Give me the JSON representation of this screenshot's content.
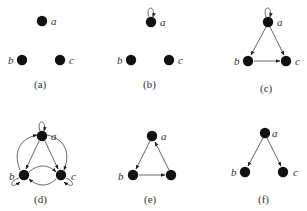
{
  "figure": {
    "panels": [
      {
        "id": "a",
        "caption": "(a)",
        "nodes": [
          {
            "id": "a",
            "label": "a",
            "x": 42,
            "y": 21
          },
          {
            "id": "b",
            "label": "b",
            "x": 22,
            "y": 60
          },
          {
            "id": "c",
            "label": "c",
            "x": 60,
            "y": 60
          }
        ],
        "edges": []
      },
      {
        "id": "b",
        "caption": "(b)",
        "nodes": [
          {
            "id": "a",
            "label": "a",
            "x": 151,
            "y": 21
          },
          {
            "id": "b",
            "label": "b",
            "x": 131,
            "y": 60
          },
          {
            "id": "c",
            "label": "c",
            "x": 169,
            "y": 60
          }
        ],
        "edges": [
          {
            "from": "a",
            "to": "a",
            "type": "loop"
          }
        ]
      },
      {
        "id": "c",
        "caption": "(c)",
        "nodes": [
          {
            "id": "a",
            "label": "a",
            "x": 268,
            "y": 22
          },
          {
            "id": "b",
            "label": "b",
            "x": 248,
            "y": 61
          },
          {
            "id": "c",
            "label": "c",
            "x": 286,
            "y": 61
          }
        ],
        "edges": [
          {
            "from": "a",
            "to": "a",
            "type": "loop"
          },
          {
            "from": "a",
            "to": "b"
          },
          {
            "from": "a",
            "to": "c"
          },
          {
            "from": "b",
            "to": "c"
          }
        ]
      },
      {
        "id": "d",
        "caption": "(d)",
        "nodes": [
          {
            "id": "a",
            "label": "a",
            "x": 42,
            "y": 136
          },
          {
            "id": "b",
            "label": "b",
            "x": 24,
            "y": 175
          },
          {
            "id": "c",
            "label": "c",
            "x": 61,
            "y": 175
          }
        ],
        "edges": [
          {
            "from": "a",
            "to": "a",
            "type": "loop"
          },
          {
            "from": "b",
            "to": "b",
            "type": "loop"
          },
          {
            "from": "c",
            "to": "c",
            "type": "loop"
          },
          {
            "from": "a",
            "to": "b"
          },
          {
            "from": "b",
            "to": "a"
          },
          {
            "from": "a",
            "to": "c"
          },
          {
            "from": "c",
            "to": "a"
          },
          {
            "from": "b",
            "to": "c"
          },
          {
            "from": "c",
            "to": "b"
          }
        ]
      },
      {
        "id": "e",
        "caption": "(e)",
        "nodes": [
          {
            "id": "a",
            "label": "a",
            "x": 152,
            "y": 136
          },
          {
            "id": "b",
            "label": "b",
            "x": 133,
            "y": 175
          },
          {
            "id": "c",
            "label": "",
            "x": 171,
            "y": 175
          }
        ],
        "edges": [
          {
            "from": "a",
            "to": "b"
          },
          {
            "from": "b",
            "to": "c"
          },
          {
            "from": "c",
            "to": "a"
          }
        ]
      },
      {
        "id": "f",
        "caption": "(f)",
        "nodes": [
          {
            "id": "a",
            "label": "a",
            "x": 265,
            "y": 133
          },
          {
            "id": "b",
            "label": "b",
            "x": 245,
            "y": 172
          },
          {
            "id": "c",
            "label": "c",
            "x": 283,
            "y": 172
          }
        ],
        "edges": [
          {
            "from": "a",
            "to": "b"
          },
          {
            "from": "a",
            "to": "c"
          }
        ]
      }
    ],
    "colors": {
      "node": "#111111",
      "edge": "#555555",
      "text": "#333333"
    }
  }
}
